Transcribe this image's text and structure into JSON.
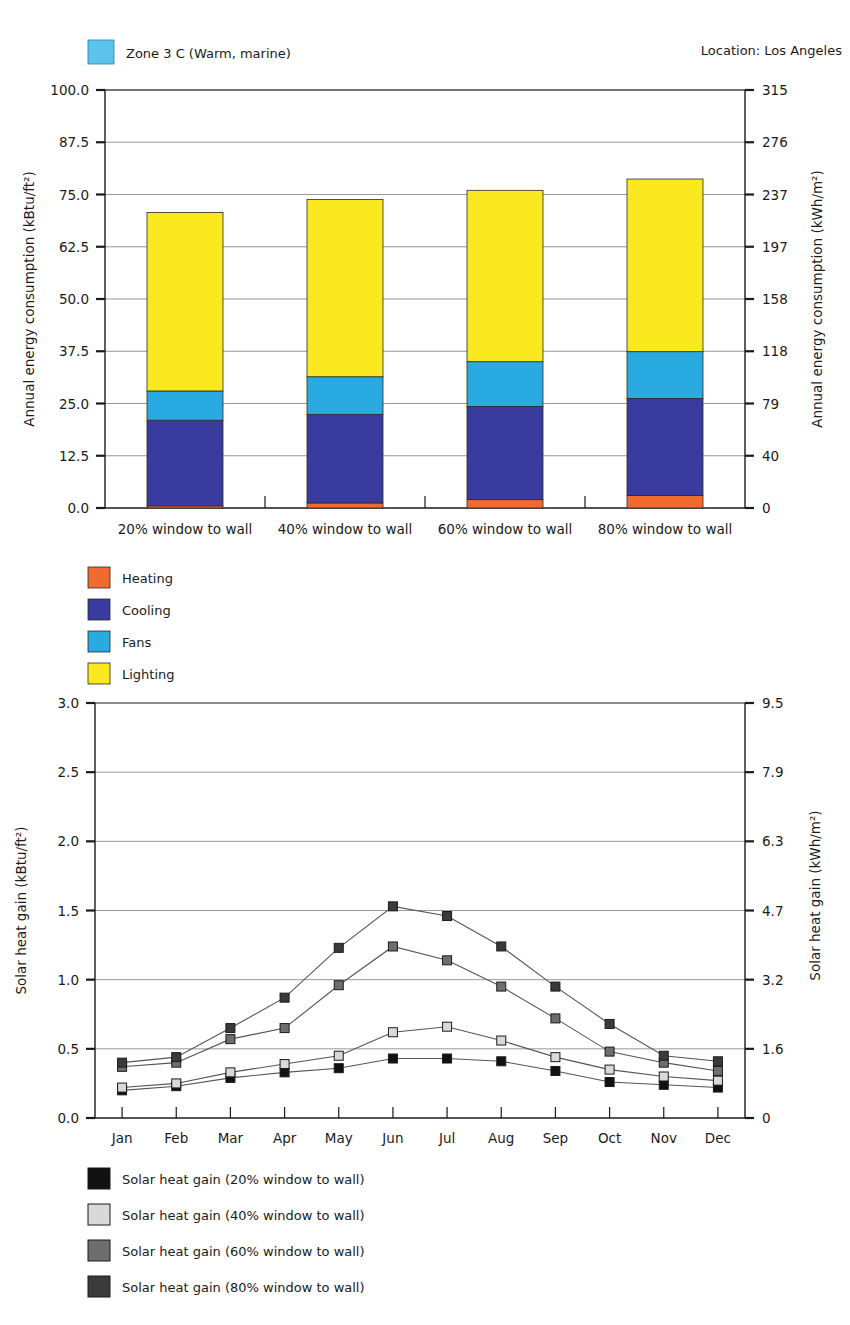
{
  "page": {
    "header_zone_label": "Zone 3 C (Warm, marine)",
    "header_zone_swatch": "#5BC3EC",
    "location_label": "Location:  Los Angeles"
  },
  "chart_data": [
    {
      "id": "energy",
      "type": "bar",
      "stacked": true,
      "title": "",
      "xlabel": "",
      "ylabel": "Annual energy consumption (kBtu/ft²)",
      "ylabel_right": "Annual energy consumption (kWh/m²)",
      "categories": [
        "20% window to wall",
        "40% window to wall",
        "60% window to wall",
        "80% window to wall"
      ],
      "ylim": [
        0,
        100
      ],
      "yticks": [
        "0.0",
        "12.5",
        "25.0",
        "37.5",
        "50.0",
        "62.5",
        "75.0",
        "87.5",
        "100.0"
      ],
      "ytick_values": [
        0,
        12.5,
        25,
        37.5,
        50,
        62.5,
        75,
        87.5,
        100
      ],
      "yticks_right": [
        "0",
        "40",
        "79",
        "118",
        "158",
        "197",
        "237",
        "276",
        "315"
      ],
      "grid": true,
      "legend_position": "below",
      "series": [
        {
          "name": "Heating",
          "color": "#F26B2E",
          "values": [
            0.5,
            1.2,
            2.0,
            3.0
          ]
        },
        {
          "name": "Cooling",
          "color": "#3A3B9E",
          "values": [
            20.5,
            21.2,
            22.3,
            23.2
          ]
        },
        {
          "name": "Fans",
          "color": "#29ABE2",
          "values": [
            7.0,
            9.0,
            10.7,
            11.2
          ]
        },
        {
          "name": "Lighting",
          "color": "#FAE91E",
          "values": [
            42.7,
            42.4,
            41.0,
            41.3
          ]
        }
      ],
      "totals": [
        70.7,
        73.8,
        76.0,
        78.7
      ]
    },
    {
      "id": "solar",
      "type": "line",
      "title": "",
      "xlabel": "",
      "ylabel": "Solar heat gain (kBtu/ft²)",
      "ylabel_right": "Solar heat gain (kWh/m²)",
      "x": [
        "Jan",
        "Feb",
        "Mar",
        "Apr",
        "May",
        "Jun",
        "Jul",
        "Aug",
        "Sep",
        "Oct",
        "Nov",
        "Dec"
      ],
      "ylim": [
        0,
        3.0
      ],
      "yticks": [
        "0.0",
        "0.5",
        "1.0",
        "1.5",
        "2.0",
        "2.5",
        "3.0"
      ],
      "ytick_values": [
        0,
        0.5,
        1.0,
        1.5,
        2.0,
        2.5,
        3.0
      ],
      "yticks_right": [
        "0",
        "1.6",
        "3.2",
        "4.7",
        "6.3",
        "7.9",
        "9.5"
      ],
      "grid": true,
      "legend_position": "below",
      "series": [
        {
          "name": "Solar heat gain (20% window to wall)",
          "color": "#111111",
          "marker": "filled-square",
          "values": [
            0.2,
            0.23,
            0.29,
            0.33,
            0.36,
            0.43,
            0.43,
            0.41,
            0.34,
            0.26,
            0.24,
            0.22
          ]
        },
        {
          "name": "Solar heat gain (40% window to wall)",
          "color": "#D9D9D9",
          "marker": "open-square",
          "values": [
            0.22,
            0.25,
            0.33,
            0.39,
            0.45,
            0.62,
            0.66,
            0.56,
            0.44,
            0.35,
            0.3,
            0.27
          ]
        },
        {
          "name": "Solar heat gain (60% window to wall)",
          "color": "#6E6E6E",
          "marker": "grey-square",
          "values": [
            0.37,
            0.4,
            0.57,
            0.65,
            0.96,
            1.24,
            1.14,
            0.95,
            0.72,
            0.48,
            0.4,
            0.34
          ]
        },
        {
          "name": "Solar heat gain (80% window to wall)",
          "color": "#3A3A3A",
          "marker": "dark-square",
          "values": [
            0.4,
            0.44,
            0.65,
            0.87,
            1.23,
            1.53,
            1.46,
            1.24,
            0.95,
            0.68,
            0.45,
            0.41
          ]
        }
      ]
    }
  ],
  "bar_legend": [
    {
      "label": "Heating",
      "color": "#F26B2E"
    },
    {
      "label": "Cooling",
      "color": "#3A3B9E"
    },
    {
      "label": "Fans",
      "color": "#29ABE2"
    },
    {
      "label": "Lighting",
      "color": "#FAE91E"
    }
  ],
  "line_legend": [
    {
      "label": "Solar heat gain (20% window to wall)",
      "color": "#111111"
    },
    {
      "label": "Solar heat gain (40% window to wall)",
      "color": "#D9D9D9"
    },
    {
      "label": "Solar heat gain (60% window to wall)",
      "color": "#6E6E6E"
    },
    {
      "label": "Solar heat gain (80% window to wall)",
      "color": "#3A3A3A"
    }
  ]
}
